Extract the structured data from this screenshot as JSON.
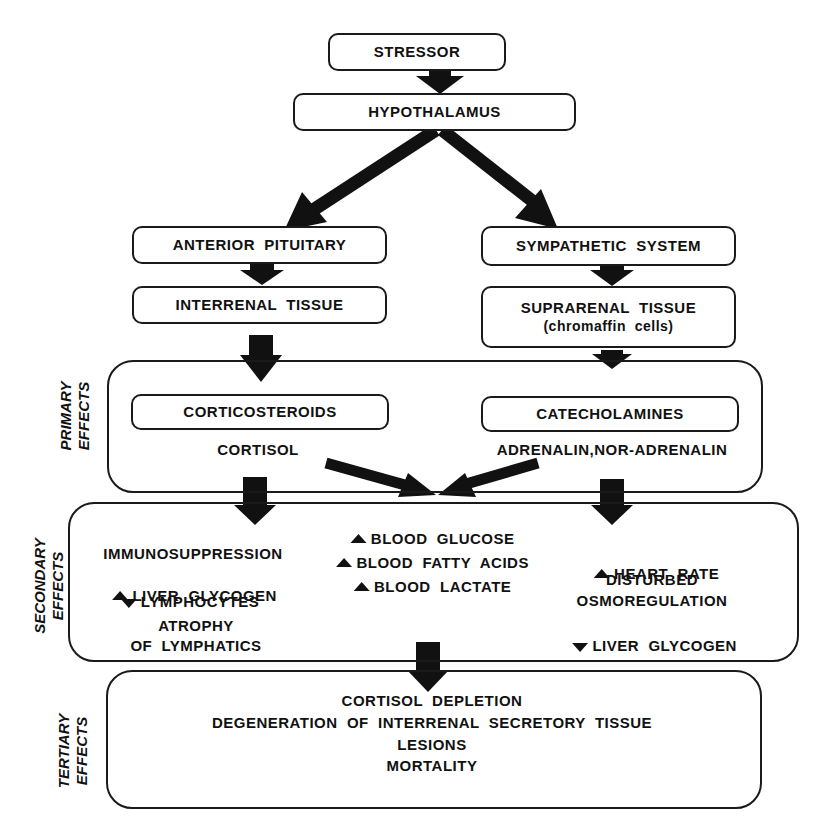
{
  "flow": {
    "stressor": "STRESSOR",
    "hypothalamus": "HYPOTHALAMUS",
    "left_branch": {
      "pituitary": "ANTERIOR  PITUITARY",
      "tissue": "INTERRENAL  TISSUE"
    },
    "right_branch": {
      "sympathetic": "SYMPATHETIC  SYSTEM",
      "tissue_line1": "SUPRARENAL  TISSUE",
      "tissue_line2": "(chromaffin  cells)"
    }
  },
  "primary": {
    "label_line1": "PRIMARY",
    "label_line2": "EFFECTS",
    "left_box": "CORTICOSTEROIDS",
    "left_text": "CORTISOL",
    "right_box": "CATECHOLAMINES",
    "right_text": "ADRENALIN,NOR-ADRENALIN"
  },
  "secondary": {
    "label_line1": "SECONDARY",
    "label_line2": "EFFECTS",
    "left": [
      {
        "dir": "none",
        "text": "IMMUNOSUPPRESSION"
      },
      {
        "dir": "up",
        "text": "LIVER  GLYCOGEN"
      },
      {
        "dir": "down",
        "text": "LYMPHOCYTES"
      },
      {
        "dir": "none",
        "text": "ATROPHY"
      },
      {
        "dir": "none",
        "text": "OF  LYMPHATICS"
      }
    ],
    "center": [
      {
        "dir": "up",
        "text": "BLOOD  GLUCOSE"
      },
      {
        "dir": "up",
        "text": "BLOOD  FATTY  ACIDS"
      },
      {
        "dir": "up",
        "text": "BLOOD  LACTATE"
      }
    ],
    "right": [
      {
        "dir": "up",
        "text": "HEART  RATE"
      },
      {
        "dir": "none",
        "text": "DISTURBED"
      },
      {
        "dir": "none",
        "text": "OSMOREGULATION"
      },
      {
        "dir": "down",
        "text": "LIVER  GLYCOGEN"
      }
    ]
  },
  "tertiary": {
    "label_line1": "TERTIARY",
    "label_line2": "EFFECTS",
    "items": [
      "CORTISOL  DEPLETION",
      "DEGENERATION  OF  INTERRENAL  SECRETORY  TISSUE",
      "LESIONS",
      "MORTALITY"
    ]
  },
  "icons": {
    "increase": "up-arrowhead-icon",
    "decrease": "down-arrowhead-icon"
  },
  "colors": {
    "ink": "#111111",
    "background": "#ffffff"
  }
}
